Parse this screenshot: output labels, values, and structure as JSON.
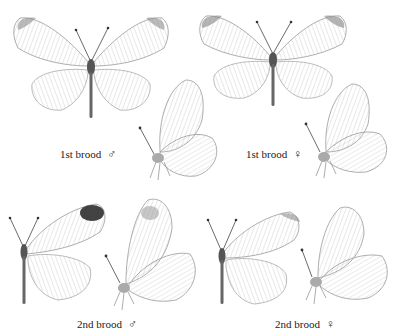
{
  "plate": {
    "figures": [
      {
        "id": "m1-upper",
        "brood": "1st brood",
        "sex": "male",
        "view": "upperside"
      },
      {
        "id": "m1-under",
        "brood": "1st brood",
        "sex": "male",
        "view": "underside"
      },
      {
        "id": "f1-upper",
        "brood": "1st brood",
        "sex": "female",
        "view": "upperside"
      },
      {
        "id": "f1-under",
        "brood": "1st brood",
        "sex": "female",
        "view": "underside"
      },
      {
        "id": "m2-upper",
        "brood": "2nd brood",
        "sex": "male",
        "view": "upperside"
      },
      {
        "id": "m2-under",
        "brood": "2nd brood",
        "sex": "male",
        "view": "underside"
      },
      {
        "id": "f2-upper",
        "brood": "2nd brood",
        "sex": "female",
        "view": "upperside"
      },
      {
        "id": "f2-under",
        "brood": "2nd brood",
        "sex": "female",
        "view": "underside"
      }
    ],
    "labels": [
      {
        "text": "1st brood",
        "symbol": "♂"
      },
      {
        "text": "1st brood",
        "symbol": "♀"
      },
      {
        "text": "2nd brood",
        "symbol": "♂"
      },
      {
        "text": "2nd brood",
        "symbol": "♀"
      }
    ]
  }
}
